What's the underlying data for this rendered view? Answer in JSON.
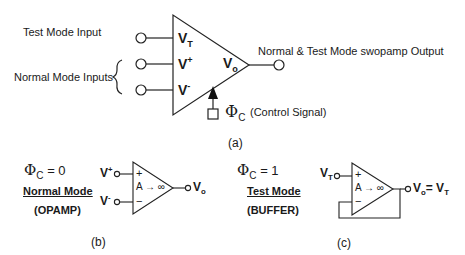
{
  "figure_a": {
    "caption": "(a)",
    "test_mode_input_label": "Test Mode Input",
    "normal_mode_inputs_label": "Normal Mode Inputs",
    "output_label": "Normal & Test Mode swopamp Output",
    "control_signal_label": "(Control Signal)",
    "control_symbol": "Φ",
    "control_sub": "C",
    "pins": {
      "vt": {
        "main": "V",
        "sub": "T"
      },
      "vplus": {
        "main": "V",
        "sup": "+"
      },
      "vminus": {
        "main": "V",
        "sup": "-"
      },
      "vo": {
        "main": "V",
        "sub": "o"
      }
    }
  },
  "figure_b": {
    "caption": "(b)",
    "phi_symbol": "Φ",
    "phi_sub": "C",
    "phi_value": " =  0",
    "mode_title": "Normal Mode",
    "mode_type": "(OPAMP)",
    "plus_sign": "+",
    "minus_sign": "−",
    "gain": "A → ∞",
    "in_plus": {
      "main": "V",
      "sup": "+"
    },
    "in_minus": {
      "main": "V",
      "sup": "-"
    },
    "out": {
      "main": "V",
      "sub": "o"
    }
  },
  "figure_c": {
    "caption": "(c)",
    "phi_symbol": "Φ",
    "phi_sub": "C",
    "phi_value": " =  1",
    "mode_title": "Test Mode",
    "mode_type": "(BUFFER)",
    "plus_sign": "+",
    "minus_sign": "−",
    "gain": "A → ∞",
    "in": {
      "main": "V",
      "sub": "T"
    },
    "out": {
      "main": "V",
      "sub": "o",
      "eq": "= V",
      "eq_sub": "T"
    }
  }
}
